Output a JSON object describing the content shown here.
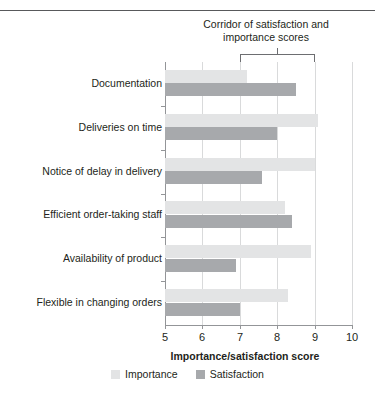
{
  "annotation": {
    "line1": "Corridor of satisfaction and",
    "line2": "importance scores",
    "range": [
      7,
      9
    ]
  },
  "legend": {
    "importance_label": "Importance",
    "satisfaction_label": "Satisfaction"
  },
  "colors": {
    "importance": "#e3e4e5",
    "satisfaction": "#a7a9ac",
    "axis": "#939598",
    "grid": "#d9dadb",
    "text": "#231f20"
  },
  "chart_data": {
    "type": "bar",
    "orientation": "horizontal",
    "title": "",
    "xlabel": "Importance/satisfaction score",
    "ylabel": "",
    "xlim": [
      5,
      10
    ],
    "xticks": [
      5,
      6,
      7,
      8,
      9,
      10
    ],
    "grid": true,
    "legend_position": "bottom",
    "categories": [
      "Documentation",
      "Deliveries on time",
      "Notice of delay in delivery",
      "Efficient order-taking staff",
      "Availability of product",
      "Flexible in changing orders"
    ],
    "series": [
      {
        "name": "Importance",
        "values": [
          7.2,
          9.1,
          9.0,
          8.2,
          8.9,
          8.3
        ]
      },
      {
        "name": "Satisfaction",
        "values": [
          8.5,
          8.0,
          7.6,
          8.4,
          6.9,
          7.0
        ]
      }
    ],
    "annotations": [
      {
        "text": "Corridor of satisfaction and importance scores",
        "type": "bracket",
        "x_range": [
          7,
          9
        ]
      }
    ]
  }
}
